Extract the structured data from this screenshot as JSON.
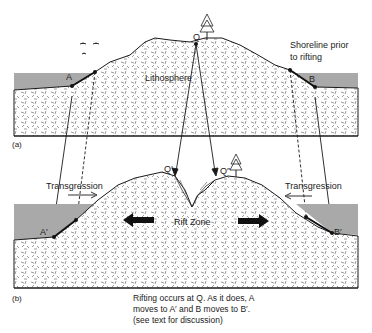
{
  "figure": {
    "panel_a": {
      "label": "(a)",
      "point_labels": {
        "a": "A",
        "b": "B",
        "q": "Q"
      },
      "region_label": "Lithosphere",
      "annotation_line1": "Shoreline prior",
      "annotation_line2": "to rifting"
    },
    "panel_b": {
      "label": "(b)",
      "point_labels": {
        "a_prime": "A′",
        "b_prime": "B′",
        "q_prime": "Q′",
        "q_double_prime": "Q″"
      },
      "left_transgression": "Transgression",
      "right_transgression": "Transgression",
      "region_label": "Rift Zone"
    },
    "caption": {
      "line1": "Rifting occurs at Q.  As it does, A",
      "line2": "moves to A′ and B moves to B′.",
      "line3": "(see text for discussion)"
    },
    "colors": {
      "sea": "#a9a9a9",
      "rock_fill": "#ffffff",
      "outline": "#1a1a1a",
      "hatch": "#555555"
    }
  }
}
